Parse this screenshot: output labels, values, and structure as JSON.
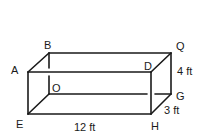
{
  "diagram": {
    "type": "rectangular-prism",
    "vertices": {
      "A": {
        "label": "A",
        "x": 28,
        "y": 72
      },
      "B": {
        "label": "B",
        "x": 49,
        "y": 53
      },
      "Q": {
        "label": "Q",
        "x": 171,
        "y": 53
      },
      "D": {
        "label": "D",
        "x": 151,
        "y": 72
      },
      "E": {
        "label": "E",
        "x": 28,
        "y": 114
      },
      "O": {
        "label": "O",
        "x": 49,
        "y": 94
      },
      "G": {
        "label": "G",
        "x": 171,
        "y": 94
      },
      "H": {
        "label": "H",
        "x": 151,
        "y": 114
      }
    },
    "dimensions": {
      "length": "12 ft",
      "height": "4 ft",
      "depth": "3 ft"
    }
  }
}
